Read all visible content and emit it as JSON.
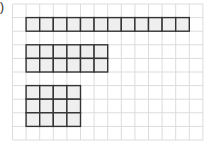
{
  "label": ")",
  "grid": {
    "origin_x": 12.5,
    "origin_y": 4,
    "cell": 13.6,
    "cols": 14,
    "rows": 10,
    "line_color": "#dcdcdc"
  },
  "shapes": [
    {
      "name": "rectangle-1x12",
      "col": 1,
      "row": 1,
      "cols": 12,
      "rows": 1
    },
    {
      "name": "rectangle-2x6",
      "col": 1,
      "row": 3,
      "cols": 6,
      "rows": 2
    },
    {
      "name": "rectangle-3x4",
      "col": 1,
      "row": 6,
      "cols": 4,
      "rows": 3
    }
  ],
  "shape_style": {
    "fill": "#efefef",
    "stroke": "#333333"
  }
}
